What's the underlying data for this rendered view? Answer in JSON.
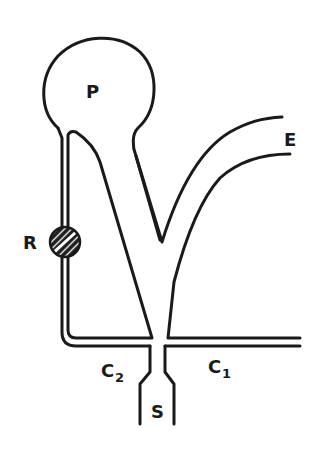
{
  "diagram": {
    "labels": {
      "P": "P",
      "E": "E",
      "R": "R",
      "C2": "C",
      "C2_sub": "2",
      "C1": "C",
      "C1_sub": "1",
      "S": "S"
    },
    "colors": {
      "line": "#1a1a1a",
      "background": "#ffffff"
    }
  }
}
